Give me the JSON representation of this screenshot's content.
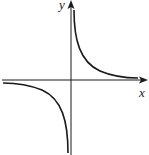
{
  "diagram": {
    "title": "",
    "function": "y = k/x (hyperbola, k > 0)",
    "axes": {
      "x_label": "x",
      "y_label": "y"
    },
    "colors": {
      "curve": "#1a1a1a",
      "axis": "#1a1a1a",
      "background": "#ffffff"
    }
  }
}
